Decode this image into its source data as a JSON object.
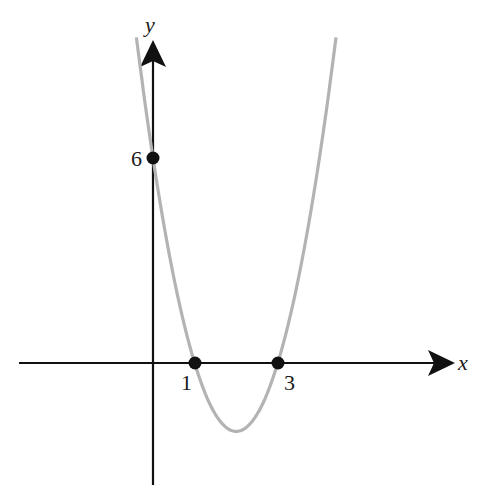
{
  "chart_data": {
    "type": "line",
    "title": "",
    "function": "y = 2(x - 1)(x - 3)",
    "xlabel": "x",
    "ylabel": "y",
    "grid": false,
    "legend": null,
    "points": [
      {
        "x": 0,
        "y": 6,
        "label": "6",
        "label_position": "left"
      },
      {
        "x": 1,
        "y": 0,
        "label": "1",
        "label_position": "below-left"
      },
      {
        "x": 3,
        "y": 0,
        "label": "3",
        "label_position": "below-right"
      }
    ],
    "vertex": {
      "x": 2,
      "y": -2
    },
    "xlim": [
      -3.2,
      7.5
    ],
    "ylim": [
      -3.6,
      9.5
    ],
    "curve_color": "#b3b3b3",
    "axis_color": "#111111"
  },
  "labels": {
    "x_axis": "x",
    "y_axis": "y",
    "y_intercept": "6",
    "root1": "1",
    "root2": "3"
  }
}
